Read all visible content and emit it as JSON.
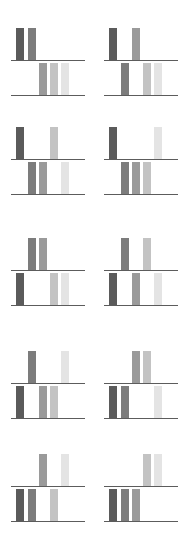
{
  "colors": {
    "slot1": "#5b5b5b",
    "slot2": "#7c7c7c",
    "slot3": "#9a9a9a",
    "slot4": "#c3c3c3",
    "slot5": "#e4e4e4",
    "baseline": "#5c5c5c"
  },
  "slot_count": 5,
  "panels": [
    {
      "top": [
        1,
        2
      ],
      "bottom": [
        3,
        4,
        5
      ]
    },
    {
      "top": [
        1,
        3
      ],
      "bottom": [
        2,
        4,
        5
      ]
    },
    {
      "top": [
        1,
        4
      ],
      "bottom": [
        2,
        3,
        5
      ]
    },
    {
      "top": [
        1,
        5
      ],
      "bottom": [
        2,
        3,
        4
      ]
    },
    {
      "top": [
        2,
        3
      ],
      "bottom": [
        1,
        4,
        5
      ]
    },
    {
      "top": [
        2,
        4
      ],
      "bottom": [
        1,
        3,
        5
      ]
    },
    {
      "top": [
        2,
        5
      ],
      "bottom": [
        1,
        3,
        4
      ]
    },
    {
      "top": [
        3,
        4
      ],
      "bottom": [
        1,
        2,
        5
      ]
    },
    {
      "top": [
        3,
        5
      ],
      "bottom": [
        1,
        2,
        4
      ]
    },
    {
      "top": [
        4,
        5
      ],
      "bottom": [
        1,
        2,
        3
      ]
    }
  ]
}
